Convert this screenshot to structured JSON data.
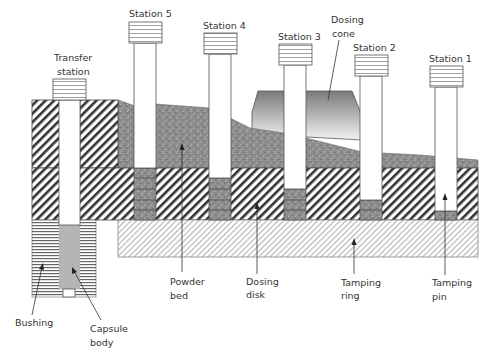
{
  "diagram": {
    "type": "cross-section",
    "colors": {
      "outline": "#444444",
      "powder": "#8f8f8f",
      "hatch": "#333333",
      "ring_hatch": "#b8b8b8",
      "capsule": "#b5b5b5",
      "cone_top": "#7a7a7a",
      "cone_bottom": "#f2f2f2"
    }
  },
  "stations": [
    {
      "label": "Station 5"
    },
    {
      "label": "Station 4"
    },
    {
      "label": "Station 3"
    },
    {
      "label": "Station 2"
    },
    {
      "label": "Station 1"
    }
  ],
  "transfer_station": {
    "line1": "Transfer",
    "line2": "station"
  },
  "callouts": {
    "dosing_cone": {
      "line1": "Dosing",
      "line2": "cone"
    },
    "powder_bed": {
      "line1": "Powder",
      "line2": "bed"
    },
    "dosing_disk": {
      "line1": "Dosing",
      "line2": "disk"
    },
    "tamping_ring": {
      "line1": "Tamping",
      "line2": "ring"
    },
    "tamping_pin": {
      "line1": "Tamping",
      "line2": "pin"
    },
    "bushing": {
      "line1": "Bushing"
    },
    "capsule_body": {
      "line1": "Capsule",
      "line2": "body"
    }
  }
}
